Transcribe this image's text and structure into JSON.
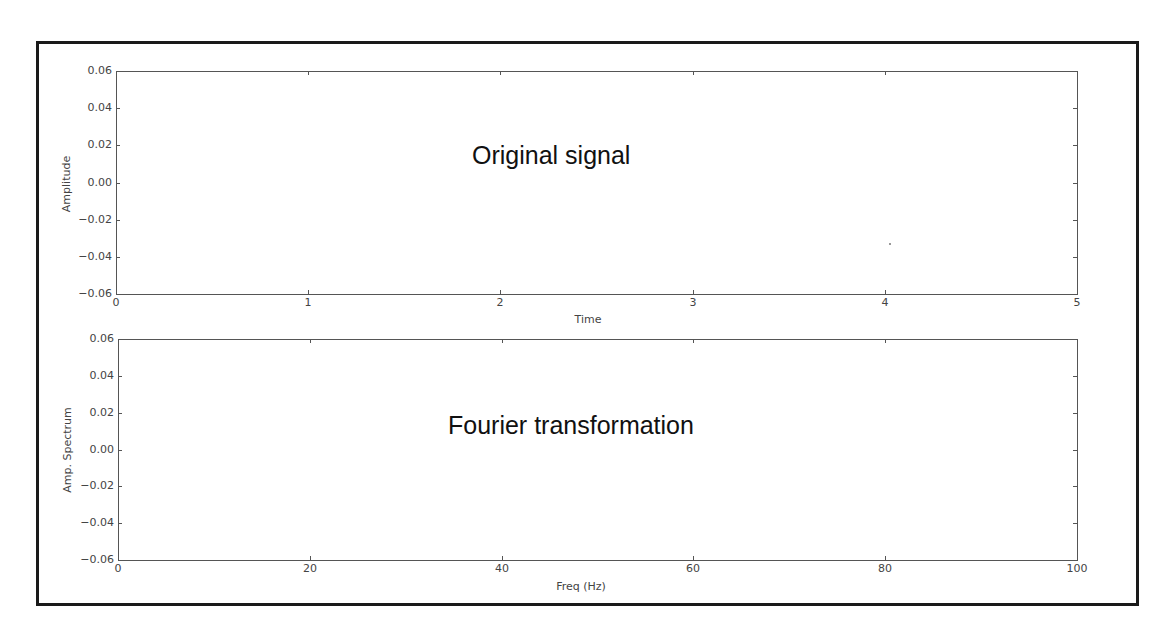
{
  "chart_data": [
    {
      "type": "line",
      "title": "",
      "annotation": "Original signal",
      "xlabel": "Time",
      "ylabel": "Amplitude",
      "xlim": [
        0,
        5
      ],
      "ylim": [
        -0.06,
        0.06
      ],
      "xticks": [
        "0",
        "1",
        "2",
        "3",
        "4",
        "5"
      ],
      "yticks": [
        "0.06",
        "0.04",
        "0.02",
        "0.00",
        "−0.02",
        "−0.04",
        "−0.06"
      ],
      "grid": false,
      "series": [],
      "points": [
        {
          "x": 4.02,
          "y": -0.033
        }
      ]
    },
    {
      "type": "line",
      "title": "",
      "annotation": "Fourier transformation",
      "xlabel": "Freq (Hz)",
      "ylabel": "Amp. Spectrum",
      "xlim": [
        0,
        100
      ],
      "ylim": [
        -0.06,
        0.06
      ],
      "xticks": [
        "0",
        "20",
        "40",
        "60",
        "80",
        "100"
      ],
      "yticks": [
        "0.06",
        "0.04",
        "0.02",
        "0.00",
        "−0.02",
        "−0.04",
        "−0.06"
      ],
      "grid": false,
      "series": []
    }
  ],
  "colors": {
    "frame": "#1a1a1a",
    "axes": "#555555",
    "text": "#444444",
    "annotation": "#111111"
  }
}
